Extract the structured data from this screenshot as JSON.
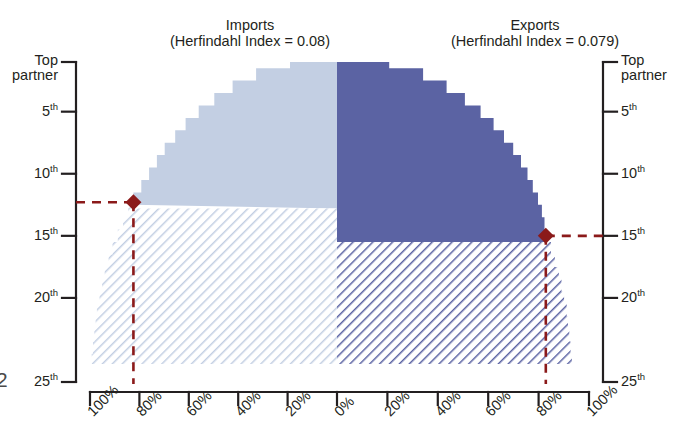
{
  "figure": {
    "edge_glyph": "2",
    "panels": [
      {
        "id": "imports",
        "title": "Imports",
        "subtitle": "(Herfindahl Index = 0.08)",
        "side": "left",
        "fill": "#c3cfe3",
        "hatch": "#c3cfe3"
      },
      {
        "id": "exports",
        "title": "Exports",
        "subtitle": "(Herfindahl Index = 0.079)",
        "side": "right",
        "fill": "#5b63a3",
        "hatch": "#5b63a3"
      }
    ],
    "y_axis": {
      "label_top": "Top",
      "label_top2": "partner",
      "ticks": [
        {
          "rank": 1,
          "text": "Top partner",
          "sup": ""
        },
        {
          "rank": 5,
          "text": "5",
          "sup": "th"
        },
        {
          "rank": 10,
          "text": "10",
          "sup": "th"
        },
        {
          "rank": 15,
          "text": "15",
          "sup": "th"
        },
        {
          "rank": 20,
          "text": "20",
          "sup": "th"
        },
        {
          "rank": 25,
          "text": "25",
          "sup": "th"
        }
      ]
    },
    "x_axis": {
      "left_ticks": [
        "100%",
        "80%",
        "60%",
        "40%",
        "20%",
        "0%"
      ],
      "right_ticks": [
        "0%",
        "20%",
        "40%",
        "60%",
        "80%",
        "100%"
      ]
    },
    "markers": [
      {
        "panel": "imports",
        "rank": 12.3,
        "percent": 78,
        "color": "#8b1a1a",
        "shape": "diamond"
      },
      {
        "panel": "exports",
        "rank": 15.0,
        "percent": 80,
        "color": "#8b1a1a",
        "shape": "diamond"
      }
    ]
  },
  "chart_data": {
    "type": "area",
    "subtitle": "Cumulative share of trade accounted for by top N partners",
    "xlabel": "Share of trade (%)",
    "ylabel": "Partner rank",
    "grid": false,
    "legend": false,
    "orientation": "mirrored-horizontal",
    "ylim": [
      1,
      25
    ],
    "xlim": [
      0,
      100
    ],
    "y_tick_values": [
      1,
      5,
      10,
      15,
      20,
      25
    ],
    "y_tick_labels": [
      "Top partner",
      "5th",
      "10th",
      "15th",
      "20th",
      "25th"
    ],
    "x_tick_values": [
      0,
      20,
      40,
      60,
      80,
      100
    ],
    "x_tick_labels": [
      "0%",
      "20%",
      "40%",
      "60%",
      "80%",
      "100%"
    ],
    "annotations": [
      {
        "text": "Imports (Herfindahl Index = 0.08)",
        "panel": "left"
      },
      {
        "text": "Exports (Herfindahl Index = 0.079)",
        "panel": "right"
      },
      {
        "text": "Imports: top 12th partner reaches ~78%",
        "panel": "left"
      },
      {
        "text": "Exports: top 15th partner reaches ~80%",
        "panel": "right"
      }
    ],
    "series": [
      {
        "name": "Imports",
        "panel": "left",
        "color": "#c3cfe3",
        "solid_until_rank": 12.3,
        "ranks": [
          1,
          2,
          3,
          4,
          5,
          6,
          7,
          8,
          9,
          10,
          11,
          12,
          13,
          14,
          15,
          16,
          17,
          18,
          19,
          20,
          21,
          22,
          23,
          24,
          25
        ],
        "cumulative_percent": [
          18,
          31,
          40,
          47,
          53,
          58,
          62,
          66,
          69,
          72,
          75,
          78,
          80,
          82,
          84,
          86,
          87.5,
          89,
          90,
          91,
          92,
          92.5,
          93,
          93.5,
          94
        ]
      },
      {
        "name": "Exports",
        "panel": "right",
        "color": "#5b63a3",
        "solid_until_rank": 15.0,
        "ranks": [
          1,
          2,
          3,
          4,
          5,
          6,
          7,
          8,
          9,
          10,
          11,
          12,
          13,
          14,
          15,
          16,
          17,
          18,
          19,
          20,
          21,
          22,
          23,
          24,
          25
        ],
        "cumulative_percent": [
          20,
          33,
          42,
          49,
          55,
          60,
          64,
          67.5,
          70.5,
          73,
          75,
          77,
          78.5,
          79.5,
          80.5,
          82,
          83.5,
          85,
          86,
          87,
          88,
          88.5,
          89,
          89.5,
          90
        ]
      }
    ]
  }
}
